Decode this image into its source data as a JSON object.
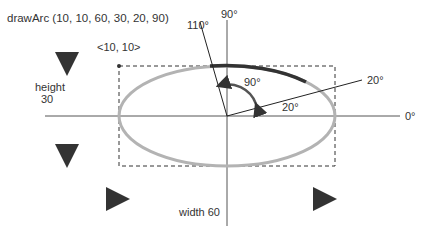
{
  "title": "drawArc (10, 10, 60, 30, 20, 90)",
  "origin_label": "<10, 10>",
  "height_label": "height",
  "height_value": "30",
  "width_label": "width 60",
  "angles": {
    "axis_90": "90°",
    "axis_0": "0°",
    "start_line": "20°",
    "start_arc": "20°",
    "end_line": "110°",
    "sweep_arc": "90°"
  },
  "colors": {
    "ellipse": "#b3b3b3",
    "arc": "#333333",
    "axis": "#444444",
    "dashed_box": "#333333"
  }
}
